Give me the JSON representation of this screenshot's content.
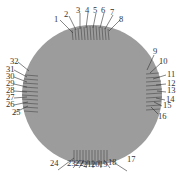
{
  "figure": {
    "type": "numbered electrode layout on circular wafer",
    "disc_color": "#9a9a9a",
    "line_color": "#444444",
    "groups": [
      {
        "position": "top",
        "labels": [
          "1",
          "2",
          "3",
          "4",
          "5",
          "6",
          "7",
          "8"
        ]
      },
      {
        "position": "right",
        "labels": [
          "9",
          "10",
          "11",
          "12",
          "13",
          "14",
          "15",
          "16"
        ]
      },
      {
        "position": "bottom",
        "labels": [
          "17",
          "18",
          "19",
          "20",
          "21",
          "22",
          "23",
          "24"
        ]
      },
      {
        "position": "left",
        "labels": [
          "25",
          "26",
          "27",
          "28",
          "29",
          "30",
          "31",
          "32"
        ]
      }
    ]
  }
}
